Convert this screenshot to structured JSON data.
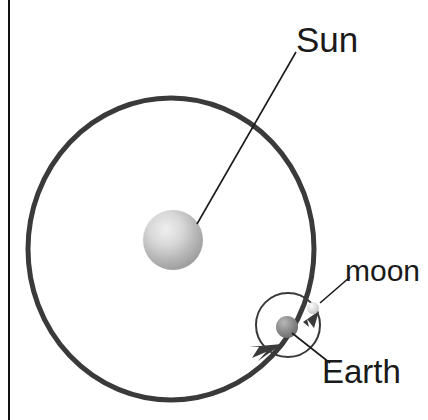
{
  "diagram": {
    "background_color": "#ffffff",
    "stroke_color": "#3a3a3a",
    "label_color": "#1a1a1a",
    "page_border": {
      "name": "left-page-rule",
      "color": "#111111",
      "x": 8,
      "width": 2
    }
  },
  "labels": {
    "sun": "Sun",
    "moon": "moon",
    "earth": "Earth"
  },
  "bodies": {
    "sun": {
      "name": "Sun",
      "cx": 173,
      "cy": 240,
      "r": 30,
      "fill_light": "#e8e8e8",
      "fill_dark": "#9a9a9a"
    },
    "earth": {
      "name": "Earth",
      "cx": 287,
      "cy": 327,
      "r": 11,
      "fill_light": "#b4b4b4",
      "fill_dark": "#6e6e6e"
    },
    "moon": {
      "name": "moon",
      "cx": 313,
      "cy": 308,
      "r": 6,
      "fill_light": "#f2f2f2",
      "fill_dark": "#c4c4c4"
    }
  },
  "orbits": {
    "earth_orbit": {
      "name": "Earth orbit around Sun",
      "cx": 171,
      "cy": 249,
      "rx": 143,
      "ry": 151,
      "stroke_width": 5,
      "direction": "counterclockwise"
    },
    "moon_orbit": {
      "name": "Moon orbit around Earth",
      "cx": 288,
      "cy": 325,
      "r": 32,
      "stroke_width": 2,
      "direction": "counterclockwise"
    }
  },
  "leader_lines": {
    "sun": {
      "x1": 197,
      "y1": 224,
      "x2": 296,
      "y2": 52
    },
    "moon": {
      "x1": 320,
      "y1": 303,
      "x2": 350,
      "y2": 277
    },
    "earth": {
      "x1": 292,
      "y1": 333,
      "x2": 330,
      "y2": 363
    }
  }
}
